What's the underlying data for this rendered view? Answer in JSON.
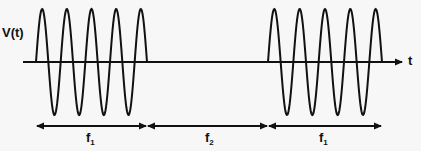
{
  "diagram": {
    "y_label": "V(t)",
    "x_label": "t",
    "segments": [
      {
        "label": "f",
        "sub": "1",
        "type": "sine-burst",
        "x_start": 36,
        "x_end": 147,
        "cycles": 4.5
      },
      {
        "label": "f",
        "sub": "2",
        "type": "flat",
        "x_start": 147,
        "x_end": 268
      },
      {
        "label": "f",
        "sub": "1",
        "type": "sine-burst",
        "x_start": 268,
        "x_end": 382,
        "cycles": 4.5
      }
    ],
    "colors": {
      "line": "#111111",
      "background": "#f7f7f7"
    }
  }
}
